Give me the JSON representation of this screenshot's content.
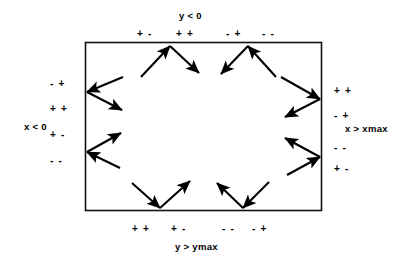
{
  "figure": {
    "type": "boundary-reflection-sign-diagram",
    "background_color": "#ffffff",
    "stroke_color": "#000000",
    "box": {
      "x": 85,
      "y": 42,
      "width": 237,
      "height": 169
    }
  },
  "edges": {
    "top": {
      "condition_label": "y < 0",
      "signs": [
        "+ -",
        "+ +",
        "- +",
        "- -"
      ]
    },
    "bottom": {
      "condition_label": "y > ymax",
      "signs": [
        "+ +",
        "+ -",
        "- -",
        "- +"
      ]
    },
    "left": {
      "condition_label": "x < 0",
      "signs": [
        "- +",
        "+ +",
        "+ -",
        "- -"
      ]
    },
    "right": {
      "condition_label": "x > xmax",
      "signs": [
        "+ +",
        "- +",
        "- -",
        "+ -"
      ]
    }
  },
  "arrows": {
    "count": 16,
    "description": "eight incoming/outgoing reflection pairs at the rectangle boundary"
  }
}
